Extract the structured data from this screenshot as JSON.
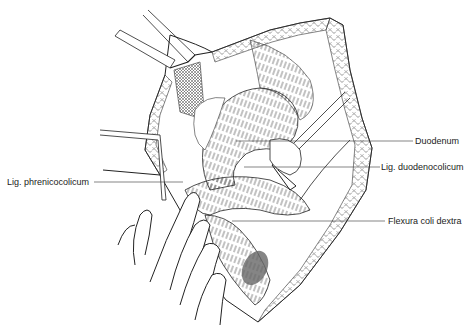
{
  "figure": {
    "type": "surgical anatomical illustration",
    "labels": [
      {
        "id": "duodenum",
        "text": "Duodenum",
        "side": "right"
      },
      {
        "id": "lig-duodenocolicum",
        "text": "Lig. duodenocolicum",
        "side": "right"
      },
      {
        "id": "lig-phrenicocolicum",
        "text": "Lig. phrenicocolicum",
        "side": "left"
      },
      {
        "id": "flexura-coli-dextra",
        "text": "Flexura coli dextra",
        "side": "right"
      }
    ]
  },
  "colors": {
    "background": "#ffffff",
    "ink": "#222222",
    "shade": "#666666"
  }
}
